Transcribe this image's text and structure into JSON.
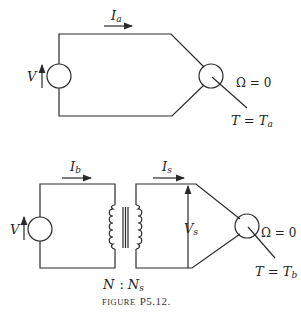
{
  "figure": {
    "caption_prefix": "FIGURE",
    "caption_number": "P5.12."
  },
  "circuit_a": {
    "source_label": "V",
    "current_label": "I",
    "current_sub": "a",
    "speed_eq": "Ω = 0",
    "torque_label": "T = T",
    "torque_sub": "a"
  },
  "circuit_b": {
    "source_label": "V",
    "primary_current_label": "I",
    "primary_current_sub": "b",
    "secondary_current_label": "I",
    "secondary_current_sub": "s",
    "secondary_voltage_label": "V",
    "secondary_voltage_sub": "s",
    "turns_ratio_left": "N",
    "turns_ratio_sep": ":",
    "turns_ratio_right": "N",
    "turns_ratio_right_sub": "s",
    "speed_eq": "Ω = 0",
    "torque_label": "T = T",
    "torque_sub": "b"
  },
  "colors": {
    "line": "#2a2a2a",
    "background": "#ffffff"
  }
}
